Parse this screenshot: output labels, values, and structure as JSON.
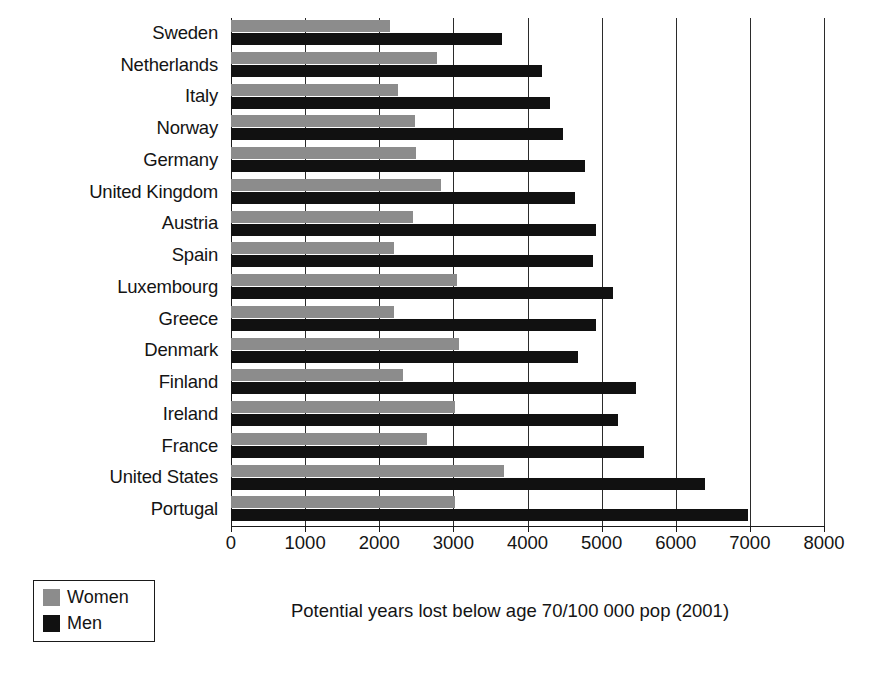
{
  "chart_data": {
    "type": "bar",
    "orientation": "horizontal",
    "title": "",
    "xlabel": "Potential years lost below age 70/100 000 pop (2001)",
    "ylabel": "",
    "xlim": [
      0,
      8000
    ],
    "xticks": [
      0,
      1000,
      2000,
      3000,
      4000,
      5000,
      6000,
      7000,
      8000
    ],
    "xtick_labels": [
      "0",
      "1000",
      "2000",
      "3000",
      "4000",
      "5000",
      "6000",
      "7000",
      "8000"
    ],
    "grid": true,
    "grid_axis": "x",
    "legend_position": "bottom-left",
    "categories": [
      "Sweden",
      "Netherlands",
      "Italy",
      "Norway",
      "Germany",
      "United Kingdom",
      "Austria",
      "Spain",
      "Luxembourg",
      "Greece",
      "Denmark",
      "Finland",
      "Ireland",
      "France",
      "United States",
      "Portugal"
    ],
    "series": [
      {
        "name": "Women",
        "color": "#8c8c8c",
        "values": [
          2150,
          2780,
          2250,
          2480,
          2500,
          2830,
          2450,
          2200,
          3050,
          2200,
          3080,
          2320,
          3020,
          2650,
          3680,
          3020
        ]
      },
      {
        "name": "Men",
        "color": "#111111",
        "values": [
          3650,
          4200,
          4300,
          4480,
          4780,
          4640,
          4930,
          4880,
          5160,
          4930,
          4680,
          5470,
          5220,
          5570,
          6400,
          6980
        ]
      }
    ]
  },
  "legend": {
    "items": [
      {
        "label": "Women",
        "color": "#8c8c8c"
      },
      {
        "label": "Men",
        "color": "#111111"
      }
    ]
  }
}
